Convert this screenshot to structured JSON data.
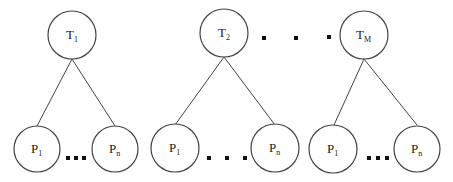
{
  "diagram": {
    "title": "",
    "trees": [
      {
        "root": {
          "base": "T",
          "sub": "1",
          "cx": 72,
          "cy": 35
        },
        "children": [
          {
            "base": "P",
            "sub": "1",
            "cx": 37,
            "cy": 149
          },
          {
            "base": "P",
            "sub": "n",
            "cx": 115,
            "cy": 149
          }
        ],
        "ellipsis": "…"
      },
      {
        "root": {
          "base": "T",
          "sub": "2",
          "cx": 224,
          "cy": 33
        },
        "children": [
          {
            "base": "P",
            "sub": "1",
            "cx": 175,
            "cy": 148
          },
          {
            "base": "P",
            "sub": "n",
            "cx": 275,
            "cy": 148
          }
        ],
        "ellipsis": "…"
      },
      {
        "root": {
          "base": "T",
          "sub": "M",
          "cx": 364,
          "cy": 35
        },
        "children": [
          {
            "base": "P",
            "sub": "1",
            "cx": 333,
            "cy": 149
          },
          {
            "base": "P",
            "sub": "n",
            "cx": 417,
            "cy": 149
          }
        ],
        "ellipsis": "…"
      }
    ],
    "between_trees_ellipsis": "…",
    "colors": {
      "stroke": "#444444",
      "dot": "#111111",
      "background": "#ffffff"
    }
  }
}
